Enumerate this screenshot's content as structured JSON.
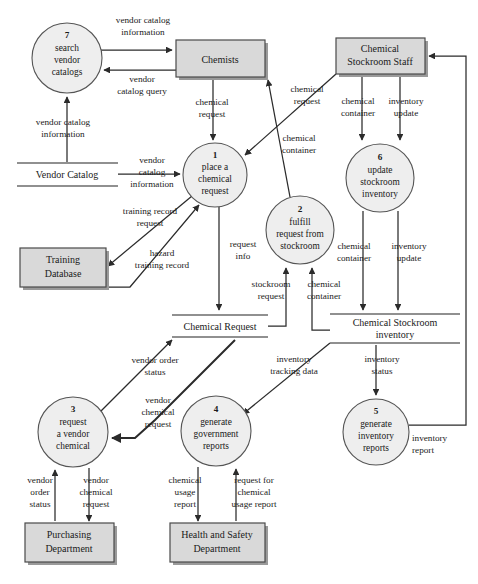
{
  "diagram": {
    "type": "data-flow-diagram",
    "colors": {
      "process_fill": "#eeeeee",
      "process_stroke": "#555555",
      "entity_fill": "#d9d9d9",
      "entity_stroke": "#4a4a4a",
      "store_line": "#6b6b6b",
      "flow_line": "#2b2b2b",
      "background": "#ffffff"
    }
  },
  "processes": [
    {
      "id": "p7",
      "number": "7",
      "line1": "search",
      "line2": "vendor",
      "line3": "catalogs",
      "cx": 67,
      "cy": 58,
      "r": 35
    },
    {
      "id": "p1",
      "number": "1",
      "line1": "place a",
      "line2": "chemical",
      "line3": "request",
      "cx": 215,
      "cy": 175,
      "r": 32
    },
    {
      "id": "p2",
      "number": "2",
      "line1": "fulfill",
      "line2": "request from",
      "line3": "stockroom",
      "cx": 300,
      "cy": 230,
      "r": 34
    },
    {
      "id": "p6",
      "number": "6",
      "line1": "update",
      "line2": "stockroom",
      "line3": "inventory",
      "cx": 380,
      "cy": 178,
      "r": 34
    },
    {
      "id": "p3",
      "number": "3",
      "line1": "request",
      "line2": "a vendor",
      "line3": "chemical",
      "cx": 73,
      "cy": 432,
      "r": 35
    },
    {
      "id": "p4",
      "number": "4",
      "line1": "generate",
      "line2": "government",
      "line3": "reports",
      "cx": 216,
      "cy": 431,
      "r": 35
    },
    {
      "id": "p5",
      "number": "5",
      "line1": "generate",
      "line2": "inventory",
      "line3": "reports",
      "cx": 376,
      "cy": 432,
      "r": 33
    }
  ],
  "entities": [
    {
      "id": "e-chemists",
      "line1": "Chemists",
      "line2": "",
      "x": 176,
      "y": 40,
      "w": 89,
      "h": 37
    },
    {
      "id": "e-stockroom-staff",
      "line1": "Chemical",
      "line2": "Stockroom Staff",
      "x": 336,
      "y": 38,
      "w": 89,
      "h": 36
    },
    {
      "id": "e-training-db",
      "line1": "Training",
      "line2": "Database",
      "x": 20,
      "y": 248,
      "w": 86,
      "h": 39
    },
    {
      "id": "e-purchasing",
      "line1": "Purchasing",
      "line2": "Department",
      "x": 25,
      "y": 523,
      "w": 89,
      "h": 39
    },
    {
      "id": "e-health-safety",
      "line1": "Health and Safety",
      "line2": "Department",
      "x": 170,
      "y": 523,
      "w": 95,
      "h": 39
    }
  ],
  "datastores": [
    {
      "id": "ds-vendor-catalog",
      "line1": "Vendor Catalog",
      "line2": "",
      "x": 17,
      "y": 162,
      "w": 101,
      "h": 24
    },
    {
      "id": "ds-chemical-request",
      "line1": "Chemical Request",
      "line2": "",
      "x": 172,
      "y": 314,
      "w": 96,
      "h": 23
    },
    {
      "id": "ds-stockroom-inventory",
      "line1": "Chemical Stockroom",
      "line2": "inventory",
      "x": 330,
      "y": 313,
      "w": 130,
      "h": 29
    }
  ],
  "flows": [
    {
      "id": "f1",
      "label_line1": "vendor catalog",
      "label_line2": "information",
      "from": "p7",
      "to": "e-chemists"
    },
    {
      "id": "f2",
      "label_line1": "vendor",
      "label_line2": "catalog query",
      "from": "e-chemists",
      "to": "p7"
    },
    {
      "id": "f3",
      "label_line1": "vendor catalog",
      "label_line2": "information",
      "from": "ds-vendor-catalog",
      "to": "p7"
    },
    {
      "id": "f4",
      "label_line1": "chemical",
      "label_line2": "request",
      "from": "e-chemists",
      "to": "p1"
    },
    {
      "id": "f5",
      "label_line1": "chemical",
      "label_line2": "request",
      "from": "e-stockroom-staff",
      "to": "p1"
    },
    {
      "id": "f6",
      "label_line1": "chemical",
      "label_line2": "container",
      "from": "p2",
      "to": "e-chemists"
    },
    {
      "id": "f7",
      "label_line1": "vendor",
      "label_line2": "catalog",
      "label_line3": "information",
      "from": "ds-vendor-catalog",
      "to": "p1"
    },
    {
      "id": "f8",
      "label_line1": "training record",
      "label_line2": "request",
      "from": "p1",
      "to": "e-training-db"
    },
    {
      "id": "f9",
      "label_line1": "hazard",
      "label_line2": "training record",
      "from": "e-training-db",
      "to": "p1"
    },
    {
      "id": "f10",
      "label_line1": "request",
      "label_line2": "info",
      "from": "p1",
      "to": "ds-chemical-request"
    },
    {
      "id": "f11",
      "label_line1": "chemical",
      "label_line2": "container",
      "from": "e-stockroom-staff",
      "to": "p6"
    },
    {
      "id": "f12",
      "label_line1": "inventory",
      "label_line2": "update",
      "from": "e-stockroom-staff",
      "to": "p6"
    },
    {
      "id": "f13",
      "label_line1": "chemical",
      "label_line2": "container",
      "from": "p6",
      "to": "ds-stockroom-inventory"
    },
    {
      "id": "f14",
      "label_line1": "inventory",
      "label_line2": "update",
      "from": "p6",
      "to": "ds-stockroom-inventory"
    },
    {
      "id": "f15",
      "label_line1": "stockroom",
      "label_line2": "request",
      "from": "ds-chemical-request",
      "to": "p2"
    },
    {
      "id": "f16",
      "label_line1": "chemical",
      "label_line2": "container",
      "from": "ds-stockroom-inventory",
      "to": "p2"
    },
    {
      "id": "f17",
      "label_line1": "vendor order",
      "label_line2": "status",
      "from": "p3",
      "to": "ds-chemical-request"
    },
    {
      "id": "f18",
      "label_line1": "vendor",
      "label_line2": "chemical",
      "label_line3": "request",
      "from": "ds-chemical-request",
      "to": "p3"
    },
    {
      "id": "f19",
      "label_line1": "inventory",
      "label_line2": "tracking data",
      "from": "ds-stockroom-inventory",
      "to": "p4"
    },
    {
      "id": "f20",
      "label_line1": "inventory",
      "label_line2": "status",
      "from": "ds-stockroom-inventory",
      "to": "p5"
    },
    {
      "id": "f21",
      "label_line1": "vendor",
      "label_line2": "order",
      "label_line3": "status",
      "from": "e-purchasing",
      "to": "p3"
    },
    {
      "id": "f22",
      "label_line1": "vendor",
      "label_line2": "chemical",
      "label_line3": "request",
      "from": "p3",
      "to": "e-purchasing"
    },
    {
      "id": "f23",
      "label_line1": "chemical",
      "label_line2": "usage",
      "label_line3": "report",
      "from": "p4",
      "to": "e-health-safety"
    },
    {
      "id": "f24",
      "label_line1": "request for",
      "label_line2": "chemical",
      "label_line3": "usage report",
      "from": "e-health-safety",
      "to": "p4"
    },
    {
      "id": "f25",
      "label_line1": "inventory",
      "label_line2": "report",
      "from": "p5",
      "to": "e-stockroom-staff"
    }
  ],
  "labels": {
    "l_vendor_catalog_info_top1": "vendor catalog",
    "l_vendor_catalog_info_top2": "information",
    "l_vendor1": "vendor",
    "l_catalog_query": "catalog query",
    "l_vendor_catalog_info_left1": "vendor catalog",
    "l_vendor_catalog_info_left2": "information",
    "l_chemical_request_a1": "chemical",
    "l_chemical_request_a2": "request",
    "l_chemical_request_b1": "chemical",
    "l_chemical_request_b2": "request",
    "l_chemical_container_a1": "chemical",
    "l_chemical_container_a2": "container",
    "l_vendor_cat_info_mid1": "vendor",
    "l_vendor_cat_info_mid2": "catalog",
    "l_vendor_cat_info_mid3": "information",
    "l_training_record_req1": "training record",
    "l_training_record_req2": "request",
    "l_hazard_training1": "hazard",
    "l_hazard_training2": "training record",
    "l_request_info1": "request",
    "l_request_info2": "info",
    "l_chem_container_stock1": "chemical",
    "l_chem_container_stock2": "container",
    "l_inventory_update_top1": "inventory",
    "l_inventory_update_top2": "update",
    "l_chem_container_down1": "chemical",
    "l_chem_container_down2": "container",
    "l_inventory_update_down1": "inventory",
    "l_inventory_update_down2": "update",
    "l_stockroom_request1": "stockroom",
    "l_stockroom_request2": "request",
    "l_chem_container_up1": "chemical",
    "l_chem_container_up2": "container",
    "l_vendor_order_status1": "vendor order",
    "l_vendor_order_status2": "status",
    "l_vendor_chem_req1": "vendor",
    "l_vendor_chem_req2": "chemical",
    "l_vendor_chem_req3": "request",
    "l_inventory_tracking1": "inventory",
    "l_inventory_tracking2": "tracking data",
    "l_inventory_status1": "inventory",
    "l_inventory_status2": "status",
    "l_vendor_order_status_b1": "vendor",
    "l_vendor_order_status_b2": "order",
    "l_vendor_order_status_b3": "status",
    "l_vendor_chem_req_b1": "vendor",
    "l_vendor_chem_req_b2": "chemical",
    "l_vendor_chem_req_b3": "request",
    "l_chem_usage_report1": "chemical",
    "l_chem_usage_report2": "usage",
    "l_chem_usage_report3": "report",
    "l_request_for_chem1": "request for",
    "l_request_for_chem2": "chemical",
    "l_request_for_chem3": "usage report",
    "l_inventory_report1": "inventory",
    "l_inventory_report2": "report"
  }
}
